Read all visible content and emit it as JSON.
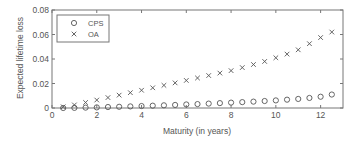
{
  "chart_data": {
    "type": "scatter",
    "title": "",
    "xlabel": "Maturity (in years)",
    "ylabel": "Expected lifetime loss",
    "xlim": [
      0,
      13
    ],
    "ylim": [
      0,
      0.08
    ],
    "xticks": [
      0,
      2,
      4,
      6,
      8,
      10,
      12
    ],
    "yticks": [
      0,
      0.02,
      0.04,
      0.06,
      0.08
    ],
    "xtick_labels": [
      "0",
      "2",
      "4",
      "6",
      "8",
      "10",
      "12"
    ],
    "ytick_labels": [
      "0",
      "0.02",
      "0.04",
      "0.06",
      "0.08"
    ],
    "grid": false,
    "legend_position": "upper left",
    "x": [
      0.5,
      1.0,
      1.5,
      2.0,
      2.5,
      3.0,
      3.5,
      4.0,
      4.5,
      5.0,
      5.5,
      6.0,
      6.5,
      7.0,
      7.5,
      8.0,
      8.5,
      9.0,
      9.5,
      10.0,
      10.5,
      11.0,
      11.5,
      12.0,
      12.5
    ],
    "series": [
      {
        "name": "CPS",
        "marker": "circle",
        "color": "#555555",
        "values": [
          0.0,
          0.0001,
          0.0003,
          0.0005,
          0.0008,
          0.001,
          0.0013,
          0.0016,
          0.0019,
          0.0022,
          0.0025,
          0.0029,
          0.0032,
          0.0036,
          0.004,
          0.0044,
          0.0048,
          0.0052,
          0.0057,
          0.0062,
          0.0068,
          0.0074,
          0.0082,
          0.0092,
          0.011
        ]
      },
      {
        "name": "OA",
        "marker": "x",
        "color": "#555555",
        "values": [
          0.001,
          0.0025,
          0.0045,
          0.0065,
          0.0085,
          0.0105,
          0.0125,
          0.0145,
          0.0165,
          0.0185,
          0.0205,
          0.0225,
          0.0245,
          0.0265,
          0.0285,
          0.0305,
          0.033,
          0.0355,
          0.038,
          0.041,
          0.044,
          0.0475,
          0.0525,
          0.0575,
          0.062
        ]
      }
    ]
  }
}
